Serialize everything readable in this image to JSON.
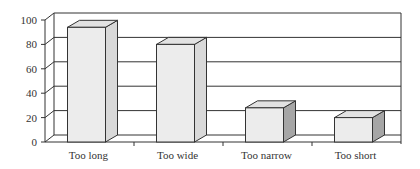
{
  "chart_data": {
    "type": "bar",
    "subtype": "3d-column",
    "title": "",
    "xlabel": "",
    "ylabel": "",
    "categories": [
      "Too long",
      "Too wide",
      "Too narrow",
      "Too short"
    ],
    "values": [
      94,
      80,
      28,
      20
    ],
    "ylim": [
      0,
      100
    ],
    "yticks": [
      0,
      20,
      40,
      60,
      80,
      100
    ],
    "grid": true,
    "legend": "none",
    "colors": {
      "bar_front": "#ececec",
      "bar_top": "#e2e2e2",
      "bar_side_light": "#d9d9d9",
      "bar_side_dark": "#a6a6a6",
      "grid": "#333333",
      "axis": "#333333"
    }
  }
}
